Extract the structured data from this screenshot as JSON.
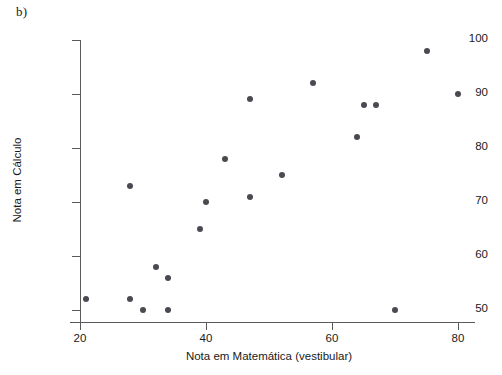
{
  "figure": {
    "label": "b)"
  },
  "chart_data": {
    "type": "scatter",
    "title": "",
    "xlabel": "Nota em Matemática (vestibular)",
    "ylabel": "Nota em Cálculo",
    "xlim": [
      18,
      82
    ],
    "ylim": [
      47,
      101
    ],
    "xticks": [
      20,
      40,
      60,
      80
    ],
    "yticks": [
      50,
      60,
      70,
      80,
      90,
      100
    ],
    "xtick_labels": [
      "20",
      "40",
      "60",
      "80"
    ],
    "ytick_labels": [
      "50",
      "60",
      "70",
      "80",
      "90",
      "100"
    ],
    "grid": false,
    "legend": null,
    "marker_color": "#4a4a50",
    "axis_color": "#5a5a5a",
    "points": [
      {
        "x": 21,
        "y": 52
      },
      {
        "x": 28,
        "y": 73
      },
      {
        "x": 28,
        "y": 52
      },
      {
        "x": 30,
        "y": 50
      },
      {
        "x": 32,
        "y": 58
      },
      {
        "x": 34,
        "y": 56
      },
      {
        "x": 34,
        "y": 50
      },
      {
        "x": 39,
        "y": 65
      },
      {
        "x": 40,
        "y": 70
      },
      {
        "x": 43,
        "y": 78
      },
      {
        "x": 47,
        "y": 89
      },
      {
        "x": 47,
        "y": 71
      },
      {
        "x": 52,
        "y": 75
      },
      {
        "x": 57,
        "y": 92
      },
      {
        "x": 64,
        "y": 82
      },
      {
        "x": 65,
        "y": 88
      },
      {
        "x": 67,
        "y": 88
      },
      {
        "x": 70,
        "y": 50
      },
      {
        "x": 75,
        "y": 98
      },
      {
        "x": 80,
        "y": 90
      }
    ]
  }
}
